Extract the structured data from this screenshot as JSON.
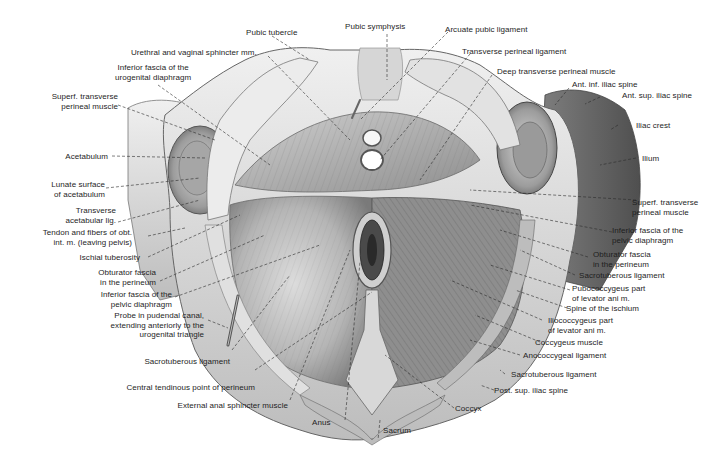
{
  "figure": {
    "colors": {
      "background": "#ffffff",
      "bone_light": "#e4e4e4",
      "bone_shadow": "#8a8a8a",
      "muscle_mid": "#a8a8a8",
      "muscle_dark": "#555555",
      "leader_line": "#2a2a2a",
      "label_text": "#1e1e1e"
    }
  },
  "labels": {
    "top": [
      {
        "id": "pubic-tubercle",
        "text": "Pubic tubercle"
      },
      {
        "id": "pubic-symphysis",
        "text": "Pubic symphysis"
      },
      {
        "id": "arcuate-pubic-ligament",
        "text": "Arcuate pubic ligament"
      },
      {
        "id": "urethral-vaginal-sphincter",
        "text": "Urethral and vaginal sphincter mm."
      },
      {
        "id": "transverse-perineal-ligament",
        "text": "Transverse perineal ligament"
      },
      {
        "id": "inferior-fascia-urogenital",
        "text": "Inferior fascia of the\nurogenital diaphragm"
      },
      {
        "id": "deep-transverse-perineal",
        "text": "Deep transverse perineal muscle"
      }
    ],
    "left": [
      {
        "id": "superf-transverse-perineal-left",
        "text": "Superf. transverse\nperineal muscle"
      },
      {
        "id": "acetabulum",
        "text": "Acetabulum"
      },
      {
        "id": "lunate-surface",
        "text": "Lunate surface\nof acetabulum"
      },
      {
        "id": "transverse-acetabular-lig",
        "text": "Transverse\nacetabular lig."
      },
      {
        "id": "tendon-obt-int",
        "text": "Tendon and fibers of obt.\nint. m. (leaving pelvis)"
      },
      {
        "id": "ischial-tuberosity",
        "text": "Ischial tuberosity"
      },
      {
        "id": "obturator-fascia-left",
        "text": "Obturator fascia\nin the perineum"
      },
      {
        "id": "inferior-fascia-pelvic-left",
        "text": "Inferior fascia of the\npelvic diaphragm"
      },
      {
        "id": "probe-pudendal-canal",
        "text": "Probe in pudendal canal,\nextending anteriorly to the\nurogenital triangle"
      },
      {
        "id": "sacrotuberous-left",
        "text": "Sacrotuberous ligament"
      },
      {
        "id": "central-tendinous-point",
        "text": "Central tendinous point of perineum"
      },
      {
        "id": "external-anal-sphincter",
        "text": "External anal sphincter muscle"
      }
    ],
    "right": [
      {
        "id": "ant-inf-iliac-spine",
        "text": "Ant. inf. iliac spine"
      },
      {
        "id": "ant-sup-iliac-spine",
        "text": "Ant. sup. iliac spine"
      },
      {
        "id": "iliac-crest",
        "text": "Iliac crest"
      },
      {
        "id": "ilium",
        "text": "Ilium"
      },
      {
        "id": "superf-transverse-perineal-right",
        "text": "Superf. transverse\nperineal muscle"
      },
      {
        "id": "inferior-fascia-pelvic-right",
        "text": "Inferior fascia of the\npelvic diaphragm"
      },
      {
        "id": "obturator-fascia-right",
        "text": "Obturator fascia\nin the perineum"
      },
      {
        "id": "sacrotuberous-right-upper",
        "text": "Sacrotuberous ligament"
      },
      {
        "id": "pubococcygeus",
        "text": "Pubococcygeus part\nof levator ani m."
      },
      {
        "id": "spine-ischium",
        "text": "Spine of the ischium"
      },
      {
        "id": "iliococcygeus",
        "text": "Iliococcygeus part\nof levator ani m."
      },
      {
        "id": "coccygeus-muscle",
        "text": "Coccygeus muscle"
      },
      {
        "id": "anococcygeal-ligament",
        "text": "Anococcygeal ligament"
      },
      {
        "id": "sacrotuberous-right-lower",
        "text": "Sacrotuberous ligament"
      },
      {
        "id": "post-sup-iliac-spine",
        "text": "Post. sup. iliac spine"
      }
    ],
    "bottom": [
      {
        "id": "anus",
        "text": "Anus"
      },
      {
        "id": "sacrum",
        "text": "Sacrum"
      },
      {
        "id": "coccyx",
        "text": "Coccyx"
      }
    ]
  }
}
